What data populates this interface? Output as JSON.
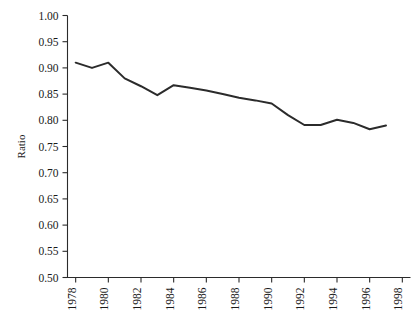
{
  "chart_data": {
    "type": "line",
    "title": "",
    "subtitle": "",
    "xlabel": "",
    "ylabel": "Ratio",
    "xlim": [
      1977.5,
      1998.5
    ],
    "ylim": [
      0.5,
      1.0
    ],
    "grid": false,
    "legend": null,
    "line_color": "#2b2b2b",
    "x": [
      1978,
      1979,
      1980,
      1981,
      1982,
      1983,
      1984,
      1985,
      1986,
      1987,
      1988,
      1989,
      1990,
      1991,
      1992,
      1993,
      1994,
      1995,
      1996,
      1997
    ],
    "series": [
      {
        "name": "Ratio",
        "values": [
          0.91,
          0.9,
          0.91,
          0.88,
          0.865,
          0.848,
          0.867,
          0.862,
          0.857,
          0.85,
          0.843,
          0.838,
          0.832,
          0.81,
          0.791,
          0.791,
          0.801,
          0.795,
          0.783,
          0.79
        ]
      }
    ],
    "x_ticks": [
      1978,
      1980,
      1982,
      1984,
      1986,
      1988,
      1990,
      1992,
      1994,
      1996,
      1998
    ],
    "x_tick_labels": [
      "1978",
      "1980",
      "1982",
      "1984",
      "1986",
      "1988",
      "1990",
      "1992",
      "1994",
      "1996",
      "1998"
    ],
    "y_ticks": [
      0.5,
      0.55,
      0.6,
      0.65,
      0.7,
      0.75,
      0.8,
      0.85,
      0.9,
      0.95,
      1.0
    ],
    "y_tick_labels": [
      "0.50",
      "0.55",
      "0.60",
      "0.65",
      "0.70",
      "0.75",
      "0.80",
      "0.85",
      "0.90",
      "0.95",
      "1.00"
    ]
  },
  "axes": {
    "y_axis_title": "Ratio"
  }
}
